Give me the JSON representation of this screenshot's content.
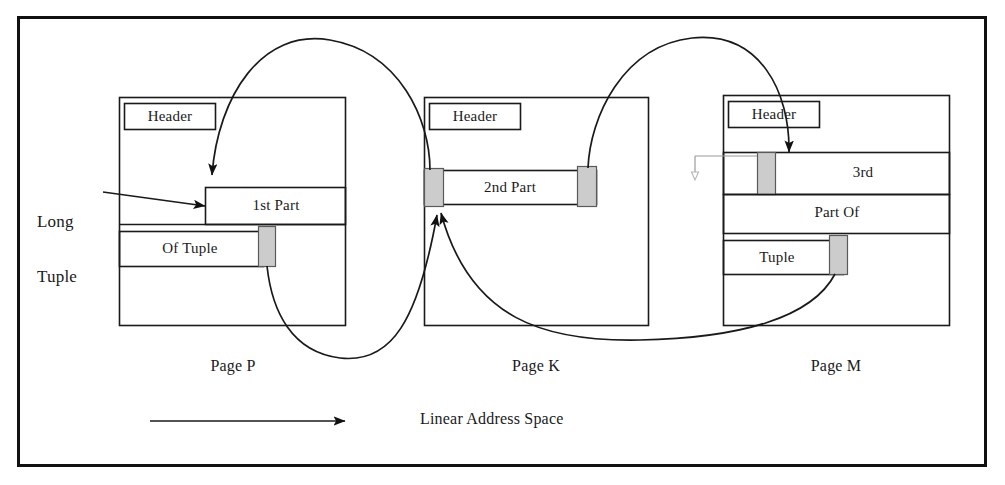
{
  "figure": {
    "frame_color": "#111111",
    "line_color": "#1a1a1a",
    "fill_gray": "#cccccc",
    "background": "#ffffff"
  },
  "annotations": {
    "long_tuple_line1": "Long",
    "long_tuple_line2": "Tuple",
    "axis_caption": "Linear Address Space"
  },
  "pages": [
    {
      "id": "page-p",
      "caption": "Page P",
      "header_label": "Header",
      "segments": [
        {
          "name": "first-part",
          "label": "1st Part",
          "marker": "right"
        },
        {
          "name": "of-tuple",
          "label": "Of Tuple",
          "marker": "right"
        }
      ]
    },
    {
      "id": "page-k",
      "caption": "Page K",
      "header_label": "Header",
      "segments": [
        {
          "name": "second-part",
          "label": "2nd Part",
          "marker": "both"
        }
      ]
    },
    {
      "id": "page-m",
      "caption": "Page M",
      "header_label": "Header",
      "segments": [
        {
          "name": "third-part",
          "label": "3rd",
          "marker": "left"
        },
        {
          "name": "part-of",
          "label": "Part Of",
          "marker": "none"
        },
        {
          "name": "tuple",
          "label": "Tuple",
          "marker": "right"
        }
      ]
    }
  ],
  "connectors": [
    {
      "name": "k-to-p-pointer",
      "from": "page-k-left-marker",
      "to": "page-p-first-part"
    },
    {
      "name": "p-to-k-pointer",
      "from": "page-p-of-tuple-marker",
      "to": "page-k-second-part"
    },
    {
      "name": "k-to-m-pointer",
      "from": "page-k-right-marker",
      "to": "page-m-third-part"
    },
    {
      "name": "m-to-k-pointer",
      "from": "page-m-tuple-marker",
      "to": "page-k-second-part"
    }
  ]
}
